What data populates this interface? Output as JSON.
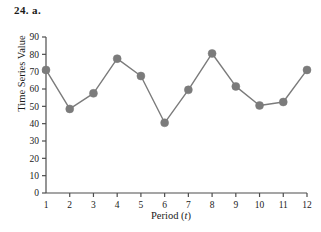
{
  "figure": {
    "label": "24.  a."
  },
  "chart_data": {
    "type": "line",
    "title": "",
    "xlabel": "Period (t)",
    "ylabel": "Time Series Value",
    "x": [
      1,
      2,
      3,
      4,
      5,
      6,
      7,
      8,
      9,
      10,
      11,
      12
    ],
    "values": [
      71,
      48.5,
      57.5,
      77.5,
      67.5,
      40.5,
      59.5,
      80.5,
      61.5,
      50.5,
      52.5,
      71
    ],
    "categories": [
      "1",
      "2",
      "3",
      "4",
      "5",
      "6",
      "7",
      "8",
      "9",
      "10",
      "11",
      "12"
    ],
    "xtick_labels": [
      "1",
      "2",
      "3",
      "4",
      "5",
      "6",
      "7",
      "8",
      "9",
      "10",
      "11",
      "12"
    ],
    "ytick_labels": [
      "0",
      "10",
      "20",
      "30",
      "40",
      "50",
      "60",
      "70",
      "80",
      "90"
    ],
    "yticks": [
      0,
      10,
      20,
      30,
      40,
      50,
      60,
      70,
      80,
      90
    ],
    "ylim": [
      0,
      90
    ],
    "xlim": [
      1,
      12
    ],
    "grid": false,
    "legend": false,
    "series_color": "#7b7b7b",
    "axis_color": "#4d4d4d",
    "marker": "circle",
    "marker_size": 4
  }
}
